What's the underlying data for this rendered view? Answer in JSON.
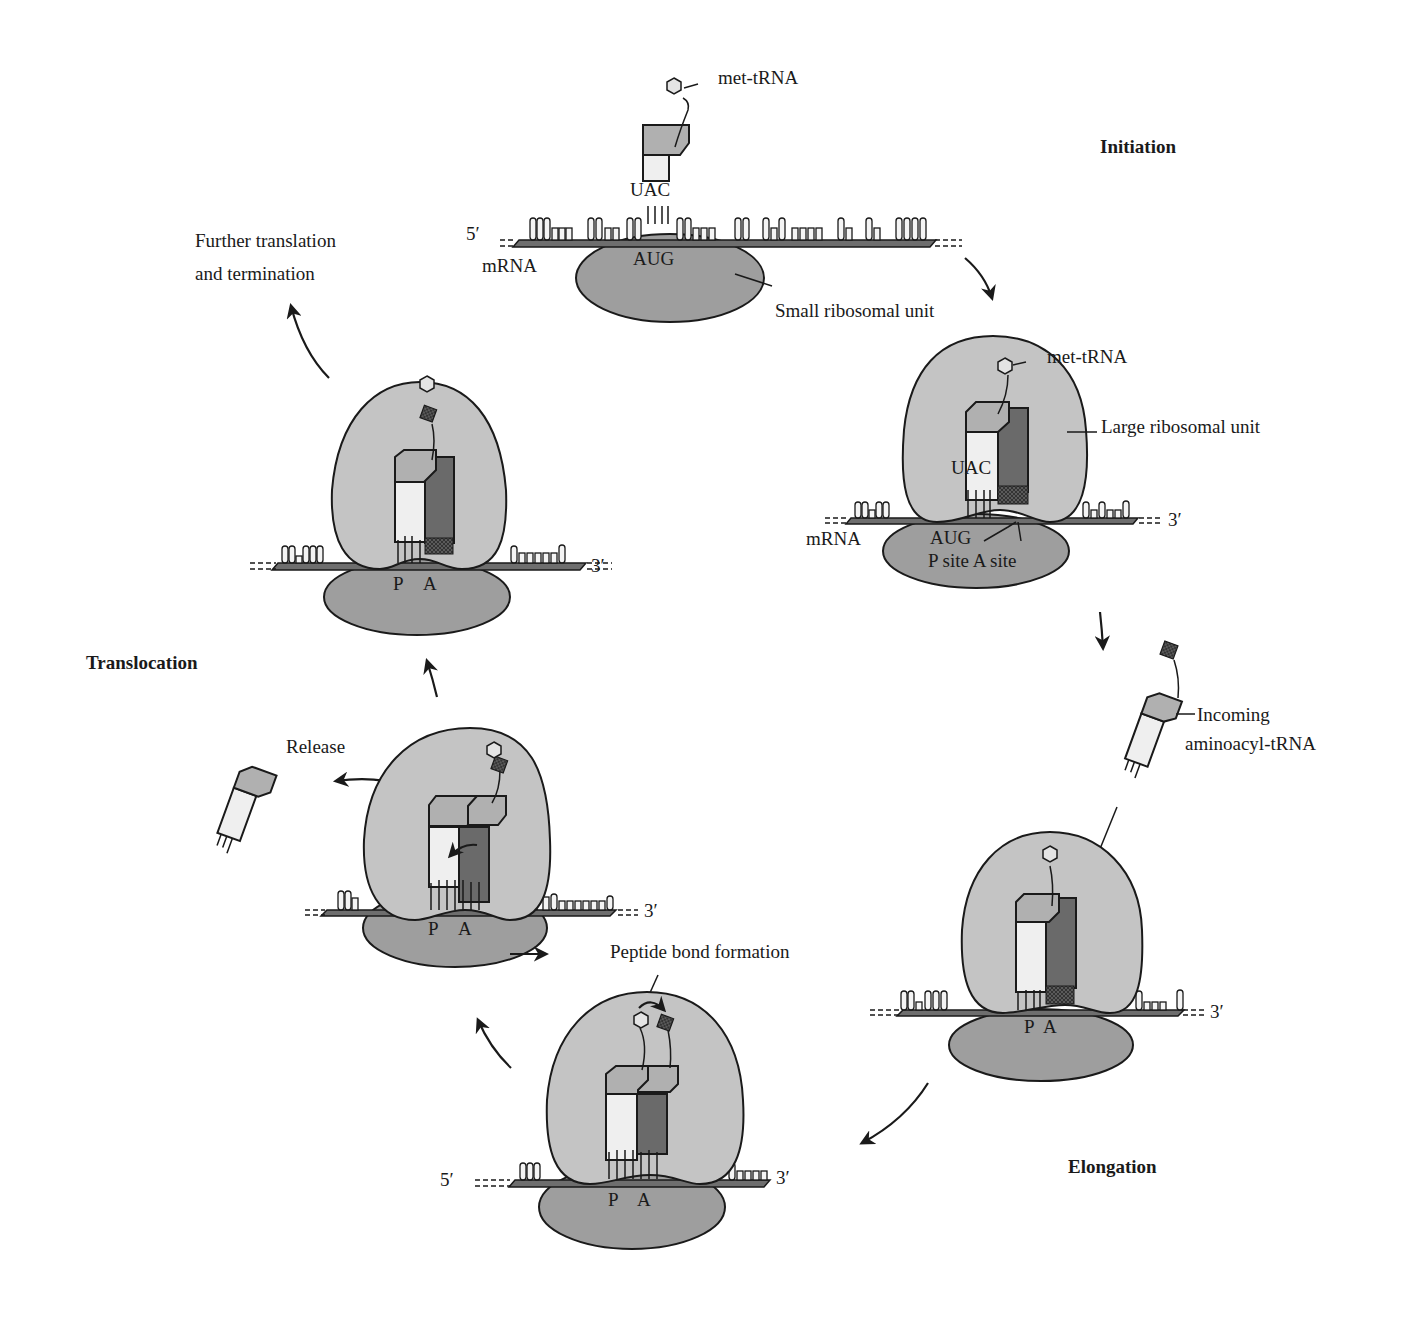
{
  "stages": {
    "initiation": "Initiation",
    "elongation": "Elongation",
    "translocation": "Translocation"
  },
  "initiation_panel": {
    "met_trna": "met-tRNA",
    "anticodon": "UAC",
    "five_prime": "5′",
    "mrna": "mRNA",
    "codon": "AUG",
    "small_unit": "Small ribosomal unit"
  },
  "assembled_panel": {
    "met_trna": "met-tRNA",
    "large_unit": "Large ribosomal unit",
    "anticodon": "UAC",
    "mrna": "mRNA",
    "codon": "AUG",
    "sites": "P site A site",
    "three_prime": "3′"
  },
  "elongation_panel": {
    "incoming_line1": "Incoming",
    "incoming_line2": "aminoacyl-tRNA",
    "p": "P",
    "a": "A",
    "three_prime": "3′"
  },
  "peptide_panel": {
    "title": "Peptide bond formation",
    "five_prime": "5′",
    "three_prime": "3′",
    "p": "P",
    "a": "A"
  },
  "release_panel": {
    "title": "Release",
    "p": "P",
    "a": "A",
    "three_prime": "3′"
  },
  "translocation_panel": {
    "p": "P",
    "a": "A",
    "three_prime": "3′"
  },
  "further": {
    "line1": "Further translation",
    "line2": "and termination"
  },
  "colors": {
    "large_subunit": "#c4c4c4",
    "small_subunit": "#9e9e9e",
    "trna_head": "#b0b0b0",
    "p_site_trna": "#efefef",
    "a_site_trna": "#6a6a6a",
    "mrna_strand": "#6e6e6e"
  }
}
